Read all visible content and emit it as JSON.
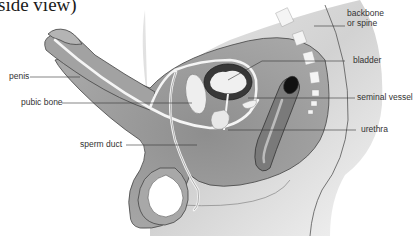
{
  "diagram": {
    "title": "side view)",
    "labels": {
      "penis": "penis",
      "pubic_bone": "pubic bone",
      "sperm_duct": "sperm duct",
      "backbone_line1": "backbone",
      "backbone_line2": "or spine",
      "bladder": "bladder",
      "seminal_vessel": "seminal vessel",
      "urethra": "urethra"
    },
    "colors": {
      "body_fill": "#9a9a9a",
      "body_light": "#c8c8c8",
      "outline": "#444444",
      "bladder_dark": "#3a3a3a",
      "bone_white": "#f2f2f2"
    }
  }
}
